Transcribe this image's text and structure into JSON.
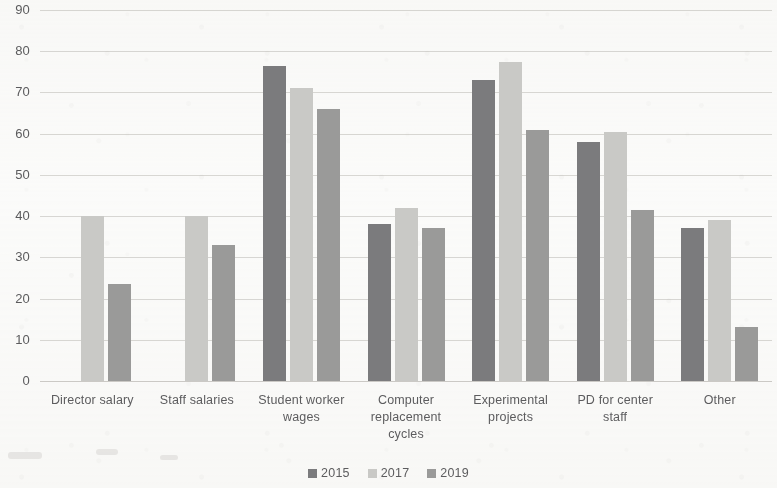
{
  "chart_data": {
    "type": "bar",
    "title": "",
    "xlabel": "",
    "ylabel": "",
    "ylim": [
      0,
      90
    ],
    "yticks": [
      0,
      10,
      20,
      30,
      40,
      50,
      60,
      70,
      80,
      90
    ],
    "grid": true,
    "legend_position": "bottom",
    "categories": [
      "Director salary",
      "Staff salaries",
      "Student worker wages",
      "Computer replacement cycles",
      "Experimental projects",
      "PD for center staff",
      "Other"
    ],
    "category_lines": [
      [
        "Director salary"
      ],
      [
        "Staff salaries"
      ],
      [
        "Student worker",
        "wages"
      ],
      [
        "Computer",
        "replacement",
        "cycles"
      ],
      [
        "Experimental",
        "projects"
      ],
      [
        "PD for center",
        "staff"
      ],
      [
        "Other"
      ]
    ],
    "series": [
      {
        "name": "2015",
        "color": "#7b7b7d",
        "values": [
          null,
          null,
          76.5,
          38,
          73,
          58,
          37
        ]
      },
      {
        "name": "2017",
        "color": "#c9c9c6",
        "values": [
          40,
          40,
          71,
          42,
          77.5,
          60.5,
          39
        ]
      },
      {
        "name": "2019",
        "color": "#9a9a99",
        "values": [
          23.5,
          33,
          66,
          37,
          61,
          41.5,
          13
        ]
      }
    ]
  },
  "axis": {
    "ytick_labels": [
      "90",
      "80",
      "70",
      "60",
      "50",
      "40",
      "30",
      "20",
      "10",
      "0"
    ]
  },
  "legend": {
    "items": [
      {
        "label": "2015",
        "color": "#7b7b7d"
      },
      {
        "label": "2017",
        "color": "#c9c9c6"
      },
      {
        "label": "2019",
        "color": "#9a9a99"
      }
    ]
  }
}
